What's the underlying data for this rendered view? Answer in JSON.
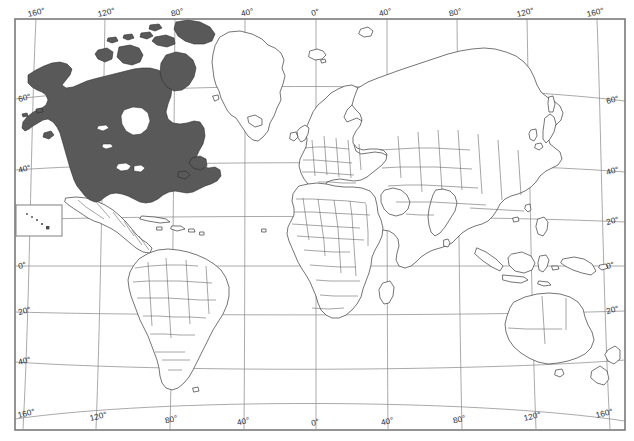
{
  "map": {
    "title": "World map with North America highlighted",
    "projection": "curved pseudo-cylindrical (Robinson-like) graticule",
    "background_color": "#ffffff",
    "frame_color": "#7a7a7a",
    "graticule_color": "#8e8e8e",
    "coastline_color": "#3a3a3a",
    "country_border_color": "#5c5c5c",
    "highlight_fill": "#595959",
    "highlight_region": "North America (United States, Canada, Alaska, Canadian Arctic Archipelago)",
    "unshaded_note": "Greenland, Mexico, Central America, South America, Europe, Africa, Asia, Australia remain unfilled",
    "graticule": {
      "longitude_interval_deg": 40,
      "latitude_interval_deg": 20
    }
  },
  "labels": {
    "top": [
      {
        "text": "160°",
        "hemisphere": "W"
      },
      {
        "text": "120°",
        "hemisphere": "W"
      },
      {
        "text": "80°",
        "hemisphere": "W"
      },
      {
        "text": "40°",
        "hemisphere": "W"
      },
      {
        "text": "0°",
        "hemisphere": ""
      },
      {
        "text": "40°",
        "hemisphere": "E"
      },
      {
        "text": "80°",
        "hemisphere": "E"
      },
      {
        "text": "120°",
        "hemisphere": "E"
      },
      {
        "text": "160°",
        "hemisphere": "E"
      }
    ],
    "bottom": [
      {
        "text": "160°",
        "hemisphere": "W"
      },
      {
        "text": "120°",
        "hemisphere": "W"
      },
      {
        "text": "80°",
        "hemisphere": "W"
      },
      {
        "text": "40°",
        "hemisphere": "W"
      },
      {
        "text": "0°",
        "hemisphere": ""
      },
      {
        "text": "40°",
        "hemisphere": "E"
      },
      {
        "text": "80°",
        "hemisphere": "E"
      },
      {
        "text": "120°",
        "hemisphere": "E"
      },
      {
        "text": "160°",
        "hemisphere": "E"
      }
    ],
    "left": [
      {
        "text": "60°",
        "hemisphere": "N"
      },
      {
        "text": "40°",
        "hemisphere": "N"
      },
      {
        "text": "0°",
        "hemisphere": ""
      },
      {
        "text": "20°",
        "hemisphere": "S"
      },
      {
        "text": "40°",
        "hemisphere": "S"
      }
    ],
    "right": [
      {
        "text": "60°",
        "hemisphere": "N"
      },
      {
        "text": "40°",
        "hemisphere": "N"
      },
      {
        "text": "20°",
        "hemisphere": "N"
      },
      {
        "text": "0°",
        "hemisphere": ""
      },
      {
        "text": "20°",
        "hemisphere": "S"
      }
    ]
  },
  "inset": {
    "name": "Hawaii inset",
    "dot_count": 5
  }
}
